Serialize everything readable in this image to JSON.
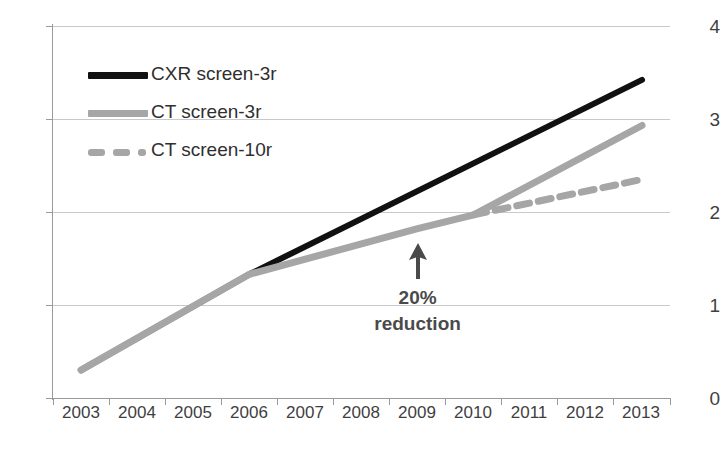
{
  "chart_data": {
    "type": "line",
    "title": "",
    "xlabel": "",
    "ylabel": "",
    "categories": [
      "2003",
      "2004",
      "2005",
      "2006",
      "2007",
      "2008",
      "2009",
      "2010",
      "2011",
      "2012",
      "2013"
    ],
    "xlim": [
      "2003",
      "2013"
    ],
    "ylim": [
      0,
      4
    ],
    "yticks": [
      "0",
      "1",
      "2",
      "3",
      "4"
    ],
    "ytick_step": 1,
    "grid": "horizontal",
    "legend_position": "inside-top-left",
    "series": [
      {
        "name": "CXR screen-3r",
        "style": "solid",
        "color": "#111111",
        "width": 6,
        "x": [
          "2003",
          "2006",
          "2013"
        ],
        "values": [
          0.3,
          1.33,
          3.42
        ]
      },
      {
        "name": "CT screen-3r",
        "style": "solid",
        "color": "#a6a6a6",
        "width": 7,
        "x": [
          "2003",
          "2006",
          "2009",
          "2010",
          "2013"
        ],
        "values": [
          0.3,
          1.33,
          1.82,
          1.97,
          2.93
        ]
      },
      {
        "name": "CT screen-10r",
        "style": "dashed",
        "color": "#a6a6a6",
        "width": 7,
        "x": [
          "2010",
          "2013"
        ],
        "values": [
          1.97,
          2.35
        ]
      }
    ],
    "annotations": [
      {
        "name": "reduction-callout",
        "icon": "up-arrow-icon",
        "text_lines": [
          "20%",
          "reduction"
        ],
        "at_x": "2009",
        "at_y": 1.75
      }
    ]
  },
  "legend": {
    "items": [
      {
        "label": "CXR screen-3r",
        "swatch": "solid-black"
      },
      {
        "label": "CT screen-3r",
        "swatch": "solid-gray"
      },
      {
        "label": "CT screen-10r",
        "swatch": "dashed-gray"
      }
    ]
  },
  "axes": {
    "y_tick_labels": [
      "4",
      "3",
      "2",
      "1",
      "0"
    ],
    "x_tick_labels": [
      "2003",
      "2004",
      "2005",
      "2006",
      "2007",
      "2008",
      "2009",
      "2010",
      "2011",
      "2012",
      "2013"
    ]
  },
  "colors": {
    "series_black": "#111111",
    "series_gray": "#a6a6a6",
    "gridline": "#c9c9c9",
    "axis": "#9a9a9a",
    "text": "#3f3f3f"
  }
}
